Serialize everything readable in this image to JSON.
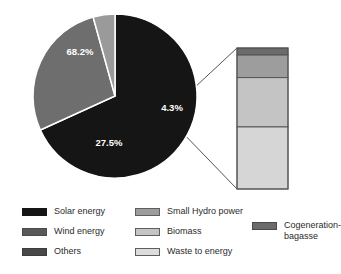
{
  "chart_data": {
    "type": "pie",
    "title": "",
    "subtitle": "",
    "xlabel": "",
    "ylabel": "",
    "grid": false,
    "legend_position": "bottom",
    "categories": [
      "Solar energy",
      "Wind energy",
      "Others"
    ],
    "values": [
      68.2,
      27.5,
      4.3
    ],
    "value_labels": [
      "68.2%",
      "27.5%",
      "4.3%"
    ],
    "colors": [
      "#151515",
      "#6e6e6e",
      "#9a9a9a"
    ],
    "units": "percent",
    "breakout": {
      "type": "bar",
      "orientation": "stacked-vertical",
      "source_slice": "Others",
      "categories": [
        "Cogeneration-bagasse",
        "Small Hydro power",
        "Biomass",
        "Waste to energy"
      ],
      "values": [
        5,
        16,
        35,
        44
      ],
      "colors": [
        "#6b6b6b",
        "#9d9d9d",
        "#c4c4c4",
        "#d6d6d6"
      ]
    }
  },
  "legend": {
    "columns": [
      {
        "items": [
          {
            "label": "Solar energy",
            "color": "#151515",
            "swatch": "legend-swatch-solar"
          },
          {
            "label": "Wind energy",
            "color": "#595959",
            "swatch": "legend-swatch-wind"
          },
          {
            "label": "Others",
            "color": "#484848",
            "swatch": "legend-swatch-others"
          }
        ]
      },
      {
        "items": [
          {
            "label": "Small Hydro power",
            "color": "#9d9d9d",
            "swatch": "legend-swatch-small-hydro-power"
          },
          {
            "label": "Biomass",
            "color": "#c4c4c4",
            "swatch": "legend-swatch-biomass"
          },
          {
            "label": "Waste to energy",
            "color": "#dcdcdc",
            "swatch": "legend-swatch-waste-to-energy"
          }
        ]
      },
      {
        "items": [
          {
            "label": "Cogeneration-\nbagasse",
            "color": "#6b6b6b",
            "swatch": "legend-swatch-cogeneration-bagasse"
          }
        ]
      }
    ]
  }
}
